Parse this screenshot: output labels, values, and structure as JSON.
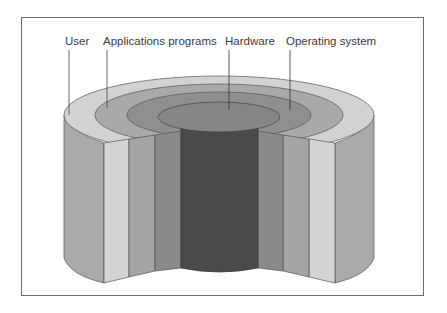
{
  "diagram": {
    "type": "layered-cylinder-cutaway",
    "labels": [
      {
        "text": "User",
        "x": 65,
        "line_x": 69,
        "line_end_y": 115
      },
      {
        "text": "Applications programs",
        "x": 103,
        "line_x": 107,
        "line_end_y": 106
      },
      {
        "text": "Hardware",
        "x": 225,
        "line_x": 229,
        "line_end_y": 110
      },
      {
        "text": "Operating system",
        "x": 286,
        "line_x": 290,
        "line_end_y": 110
      }
    ],
    "layers_outer_to_inner": [
      "User",
      "Applications programs",
      "Operating system",
      "Hardware"
    ],
    "colors": {
      "frame": "#6a6a6a",
      "top_user": "#d2d2d2",
      "top_apps": "#a9a9a9",
      "top_os": "#8f8f8f",
      "top_hw": "#868686",
      "side_outer": "#aaaaaa",
      "cut_user": "#d4d4d4",
      "cut_apps": "#a4a4a4",
      "cut_os": "#8a8a8a",
      "core_hw": "#4a4a4a",
      "edge": "#555555"
    }
  }
}
